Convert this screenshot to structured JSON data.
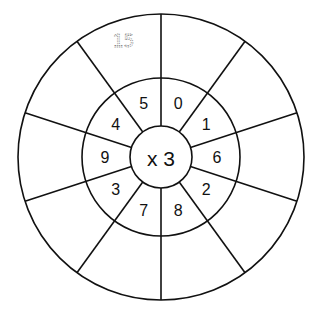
{
  "wheel": {
    "operator_label": "x 3",
    "multiplier": 3,
    "inner_numbers": [
      "0",
      "1",
      "6",
      "2",
      "8",
      "7",
      "3",
      "9",
      "4",
      "5"
    ],
    "answers": [
      "",
      "",
      "",
      "",
      "",
      "",
      "",
      "",
      "",
      "15"
    ],
    "colors": {
      "line": "#111111",
      "text": "#111111",
      "example_answer": "#888888",
      "background": "#ffffff"
    }
  }
}
